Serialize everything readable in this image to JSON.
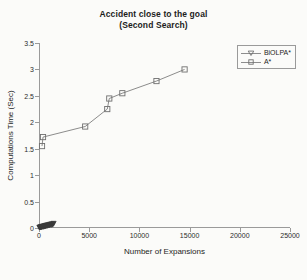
{
  "chart_data": {
    "type": "line",
    "title": "Accident close to the goal",
    "subtitle": "(Second Search)",
    "xlabel": "Number of Expansions",
    "ylabel": "Computations Time (Sec)",
    "xlim": [
      0,
      25000
    ],
    "ylim": [
      0,
      3.5
    ],
    "xticks": [
      0,
      5000,
      10000,
      15000,
      20000,
      25000
    ],
    "xtick_labels": [
      "0",
      "5000",
      "10000",
      "15000",
      "20000",
      "25000"
    ],
    "yticks": [
      0,
      0.5,
      1,
      1.5,
      2,
      2.5,
      3,
      3.5
    ],
    "ytick_labels": [
      "0",
      "0.5",
      "1",
      "1.5",
      "2",
      "2.5",
      "3",
      "3.5"
    ],
    "grid": false,
    "legend_position": "upper right",
    "series": [
      {
        "name": "BiOLPA*",
        "marker": "triangle-down",
        "color": "#3a3a3a",
        "points": [
          [
            40,
            0.01
          ],
          [
            90,
            0.012
          ],
          [
            140,
            0.015
          ],
          [
            190,
            0.02
          ],
          [
            240,
            0.018
          ],
          [
            300,
            0.025
          ],
          [
            340,
            0.03
          ],
          [
            400,
            0.022
          ],
          [
            450,
            0.035
          ],
          [
            510,
            0.028
          ],
          [
            560,
            0.04
          ],
          [
            620,
            0.032
          ],
          [
            680,
            0.045
          ],
          [
            730,
            0.05
          ],
          [
            790,
            0.038
          ],
          [
            850,
            0.055
          ],
          [
            910,
            0.048
          ],
          [
            980,
            0.06
          ],
          [
            1050,
            0.052
          ],
          [
            1120,
            0.07
          ],
          [
            1200,
            0.058
          ],
          [
            1280,
            0.075
          ],
          [
            1360,
            0.065
          ],
          [
            1450,
            0.085
          ]
        ]
      },
      {
        "name": "A*",
        "marker": "square",
        "color": "#6f6f6f",
        "points": [
          [
            300,
            1.55
          ],
          [
            400,
            1.72
          ],
          [
            4600,
            1.92
          ],
          [
            6800,
            2.25
          ],
          [
            7000,
            2.45
          ],
          [
            8300,
            2.55
          ],
          [
            11700,
            2.78
          ],
          [
            14500,
            3.0
          ]
        ]
      }
    ]
  },
  "legend": {
    "entries": [
      {
        "label": "BiOLPA*"
      },
      {
        "label": "A*"
      }
    ]
  }
}
